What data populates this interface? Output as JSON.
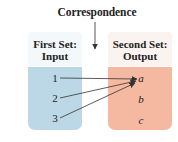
{
  "diagram": {
    "title": "Correspondence",
    "first_set": {
      "header_line1": "First Set:",
      "header_line2": "Input",
      "color": "#bcd8e6",
      "items": [
        "1",
        "2",
        "3"
      ]
    },
    "second_set": {
      "header_line1": "Second Set:",
      "header_line2": "Output",
      "color": "#f5b8a0",
      "items": [
        "a",
        "b",
        "c"
      ]
    },
    "mappings": [
      {
        "from": "1",
        "to": "a"
      },
      {
        "from": "2",
        "to": "a"
      },
      {
        "from": "3",
        "to": "a"
      }
    ]
  }
}
